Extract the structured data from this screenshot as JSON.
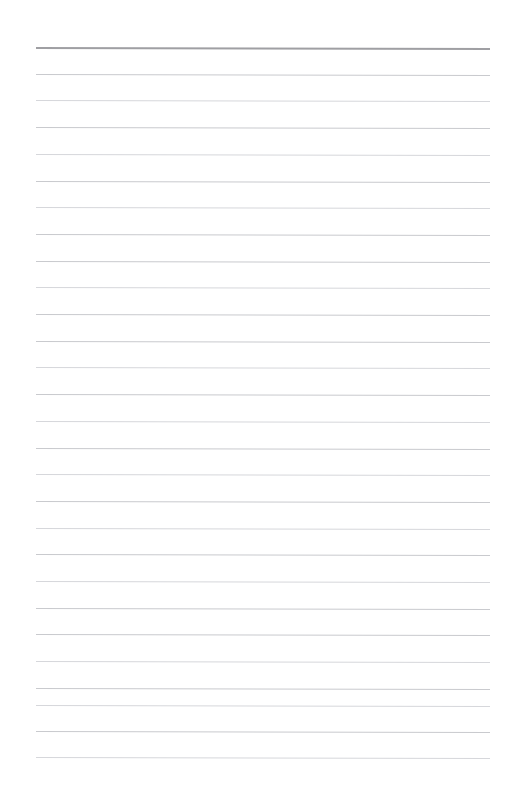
{
  "page": {
    "kind": "lined-paper",
    "width_px": 518,
    "height_px": 794,
    "background_color": "#ffffff",
    "content_text": "",
    "has_text": false,
    "has_images": false,
    "orientation": "portrait"
  },
  "ruling": {
    "margin_left_px": 36,
    "margin_right_px": 28,
    "rule_length_px": 454,
    "line_spacing_px": 26.7,
    "first_rule_y_px": 47,
    "last_rule_y_px": 757,
    "total_rules": 28,
    "slant_deg": 0.12,
    "header_rule": {
      "label": "header-rule",
      "y_px": 47,
      "thickness_px": 2,
      "color": "#9a9a9e"
    },
    "body_rule": {
      "label": "body-rule",
      "thickness_px": 1,
      "color": "#c9cace",
      "color_faint": "#d6d7db"
    },
    "rules": [
      {
        "index": 0,
        "y": 47,
        "type": "header",
        "faint": false
      },
      {
        "index": 1,
        "y": 73.7,
        "type": "body",
        "faint": false
      },
      {
        "index": 2,
        "y": 100.4,
        "type": "body",
        "faint": true
      },
      {
        "index": 3,
        "y": 127.1,
        "type": "body",
        "faint": false
      },
      {
        "index": 4,
        "y": 153.8,
        "type": "body",
        "faint": true
      },
      {
        "index": 5,
        "y": 180.5,
        "type": "body",
        "faint": false
      },
      {
        "index": 6,
        "y": 207.2,
        "type": "body",
        "faint": true
      },
      {
        "index": 7,
        "y": 233.9,
        "type": "body",
        "faint": false
      },
      {
        "index": 8,
        "y": 260.6,
        "type": "body",
        "faint": false
      },
      {
        "index": 9,
        "y": 287.3,
        "type": "body",
        "faint": true
      },
      {
        "index": 10,
        "y": 314.0,
        "type": "body",
        "faint": false
      },
      {
        "index": 11,
        "y": 340.7,
        "type": "body",
        "faint": false
      },
      {
        "index": 12,
        "y": 367.4,
        "type": "body",
        "faint": true
      },
      {
        "index": 13,
        "y": 394.1,
        "type": "body",
        "faint": false
      },
      {
        "index": 14,
        "y": 420.8,
        "type": "body",
        "faint": true
      },
      {
        "index": 15,
        "y": 447.5,
        "type": "body",
        "faint": false
      },
      {
        "index": 16,
        "y": 474.2,
        "type": "body",
        "faint": true
      },
      {
        "index": 17,
        "y": 500.9,
        "type": "body",
        "faint": false
      },
      {
        "index": 18,
        "y": 527.6,
        "type": "body",
        "faint": true
      },
      {
        "index": 19,
        "y": 554.3,
        "type": "body",
        "faint": false
      },
      {
        "index": 20,
        "y": 581.0,
        "type": "body",
        "faint": true
      },
      {
        "index": 21,
        "y": 607.7,
        "type": "body",
        "faint": false
      },
      {
        "index": 22,
        "y": 634.4,
        "type": "body",
        "faint": false
      },
      {
        "index": 23,
        "y": 661.1,
        "type": "body",
        "faint": true
      },
      {
        "index": 24,
        "y": 687.8,
        "type": "body",
        "faint": false
      },
      {
        "index": 25,
        "y": 704.5,
        "type": "body",
        "faint": true
      },
      {
        "index": 26,
        "y": 731.2,
        "type": "body",
        "faint": false
      },
      {
        "index": 27,
        "y": 757.0,
        "type": "body",
        "faint": true
      }
    ]
  }
}
